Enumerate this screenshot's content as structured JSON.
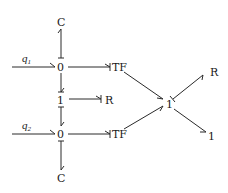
{
  "diagram": {
    "type": "bond-graph",
    "nodes": {
      "q1": {
        "label": "q",
        "sub": "1"
      },
      "q2": {
        "label": "q",
        "sub": "2"
      },
      "c_top": {
        "label": "C"
      },
      "zero_top": {
        "label": "0"
      },
      "one_mid": {
        "label": "1"
      },
      "r_mid": {
        "label": "R"
      },
      "zero_bot": {
        "label": "0"
      },
      "c_bot": {
        "label": "C"
      },
      "tf_top": {
        "label": "TF"
      },
      "tf_bot": {
        "label": "TF"
      },
      "one_right": {
        "label": "1"
      },
      "r_right": {
        "label": "R"
      },
      "one_out": {
        "label": "1"
      }
    },
    "bonds": [
      {
        "from": "q1",
        "to": "zero_top"
      },
      {
        "from": "zero_top",
        "to": "c_top"
      },
      {
        "from": "zero_top",
        "to": "tf_top"
      },
      {
        "from": "zero_top",
        "to": "one_mid"
      },
      {
        "from": "one_mid",
        "to": "r_mid"
      },
      {
        "from": "one_mid",
        "to": "zero_bot"
      },
      {
        "from": "q2",
        "to": "zero_bot"
      },
      {
        "from": "zero_bot",
        "to": "tf_bot"
      },
      {
        "from": "zero_bot",
        "to": "c_bot"
      },
      {
        "from": "tf_top",
        "to": "one_right"
      },
      {
        "from": "tf_bot",
        "to": "one_right"
      },
      {
        "from": "one_right",
        "to": "r_right"
      },
      {
        "from": "one_right",
        "to": "one_out"
      }
    ]
  }
}
